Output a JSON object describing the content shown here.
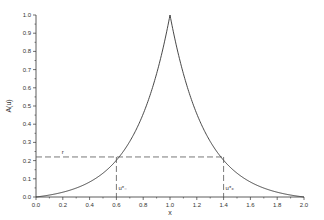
{
  "chart_data": {
    "type": "line",
    "title": "",
    "xlabel": "x",
    "ylabel": "A(u)",
    "xlim": [
      0.0,
      2.0
    ],
    "ylim": [
      0.0,
      1.0
    ],
    "x_ticks": [
      "0.0",
      "0.2",
      "0.4",
      "0.6",
      "0.8",
      "1.0",
      "1.2",
      "1.4",
      "1.6",
      "1.8",
      "2.0"
    ],
    "y_ticks": [
      "0.0",
      "0.1",
      "0.2",
      "0.3",
      "0.4",
      "0.5",
      "0.6",
      "0.7",
      "0.8",
      "0.9",
      "1.0"
    ],
    "grid": false,
    "series": [
      {
        "name": "A(u)",
        "x": [
          0.0,
          0.1,
          0.2,
          0.3,
          0.4,
          0.5,
          0.6,
          0.7,
          0.8,
          0.9,
          0.95,
          1.0,
          1.05,
          1.1,
          1.2,
          1.3,
          1.4,
          1.5,
          1.6,
          1.7,
          1.8,
          1.9,
          2.0
        ],
        "values": [
          0.0,
          0.005,
          0.02,
          0.05,
          0.09,
          0.15,
          0.22,
          0.32,
          0.45,
          0.64,
          0.79,
          1.0,
          0.79,
          0.64,
          0.45,
          0.32,
          0.22,
          0.15,
          0.09,
          0.05,
          0.02,
          0.005,
          0.0
        ]
      }
    ],
    "annotations": [
      {
        "type": "hline-dashed",
        "y": 0.22,
        "x_from": 0.0,
        "x_to": 1.4,
        "label": "r"
      },
      {
        "type": "vline-dashed",
        "x": 0.6,
        "y_from": 0.0,
        "y_to": 0.22,
        "label": "u*₋"
      },
      {
        "type": "vline-dashed",
        "x": 1.4,
        "y_from": 0.0,
        "y_to": 0.22,
        "label": "u*₊"
      }
    ]
  }
}
